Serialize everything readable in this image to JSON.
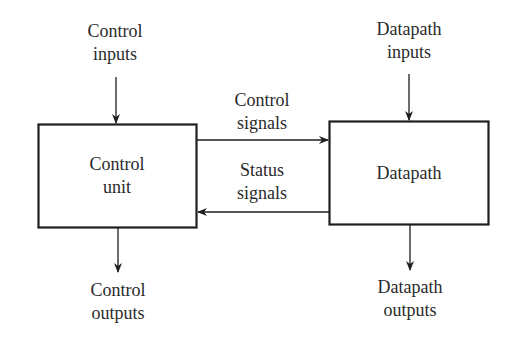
{
  "diagram": {
    "type": "block-diagram",
    "colors": {
      "stroke": "#1e1e1e",
      "text": "#2a2a2a",
      "background": "#ffffff"
    },
    "blocks": {
      "control_unit": {
        "line1": "Control",
        "line2": "unit"
      },
      "datapath": {
        "line1": "Datapath"
      }
    },
    "labels": {
      "control_inputs": {
        "line1": "Control",
        "line2": "inputs"
      },
      "datapath_inputs": {
        "line1": "Datapath",
        "line2": "inputs"
      },
      "control_signals": {
        "line1": "Control",
        "line2": "signals"
      },
      "status_signals": {
        "line1": "Status",
        "line2": "signals"
      },
      "control_outputs": {
        "line1": "Control",
        "line2": "outputs"
      },
      "datapath_outputs": {
        "line1": "Datapath",
        "line2": "outputs"
      }
    },
    "edges": [
      {
        "from": "Control inputs",
        "to": "Control unit",
        "direction": "down"
      },
      {
        "from": "Datapath inputs",
        "to": "Datapath",
        "direction": "down"
      },
      {
        "from": "Control unit",
        "to": "Datapath",
        "label": "Control signals",
        "direction": "right"
      },
      {
        "from": "Datapath",
        "to": "Control unit",
        "label": "Status signals",
        "direction": "left"
      },
      {
        "from": "Control unit",
        "to": "Control outputs",
        "direction": "down"
      },
      {
        "from": "Datapath",
        "to": "Datapath outputs",
        "direction": "down"
      }
    ]
  }
}
